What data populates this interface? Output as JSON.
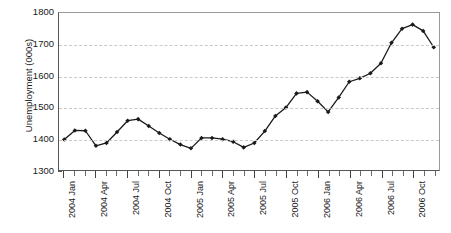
{
  "chart_data": {
    "type": "line",
    "title": "",
    "xlabel": "",
    "ylabel": "Unemployment (000s)",
    "ylim": [
      1300,
      1800
    ],
    "ytick_values": [
      1300,
      1400,
      1500,
      1600,
      1700,
      1800
    ],
    "ytick_labels": [
      "1300",
      "1400",
      "1500",
      "1600",
      "1700",
      "1800"
    ],
    "grid": "horizontal-dashed",
    "legend": "none",
    "marker": "filled-diamond",
    "line_color": "#1a1a1a",
    "grid_color": "#c9c9c9",
    "x": [
      "2004 Jan",
      "2004 Feb",
      "2004 Mar",
      "2004 Apr",
      "2004 May",
      "2004 Jun",
      "2004 Jul",
      "2004 Aug",
      "2004 Sep",
      "2004 Oct",
      "2004 Nov",
      "2004 Dec",
      "2005 Jan",
      "2005 Feb",
      "2005 Mar",
      "2005 Apr",
      "2005 May",
      "2005 Jun",
      "2005 Jul",
      "2005 Aug",
      "2005 Sep",
      "2005 Oct",
      "2005 Nov",
      "2005 Dec",
      "2006 Jan",
      "2006 Feb",
      "2006 Mar",
      "2006 Apr",
      "2006 May",
      "2006 Jun",
      "2006 Jul",
      "2006 Aug",
      "2006 Sep",
      "2006 Oct",
      "2006 Nov",
      "2006 Dec"
    ],
    "xtick_labels": [
      "2004 Jan",
      "2004 Apr",
      "2004 Jul",
      "2004 Oct",
      "2005 Jan",
      "2005 Apr",
      "2005 Jul",
      "2005 Oct",
      "2006 Jan",
      "2006 Apr",
      "2006 Jul",
      "2006 Oct"
    ],
    "xtick_label_indices": [
      0,
      3,
      6,
      9,
      12,
      15,
      18,
      21,
      24,
      27,
      30,
      33
    ],
    "values": [
      1397,
      1426,
      1425,
      1377,
      1386,
      1421,
      1457,
      1462,
      1440,
      1418,
      1398,
      1381,
      1369,
      1402,
      1402,
      1398,
      1390,
      1372,
      1386,
      1424,
      1472,
      1499,
      1544,
      1548,
      1519,
      1485,
      1531,
      1581,
      1592,
      1608,
      1640,
      1705,
      1750,
      1763,
      1743,
      1691
    ],
    "values_tail": [
      1655,
      1636
    ]
  }
}
